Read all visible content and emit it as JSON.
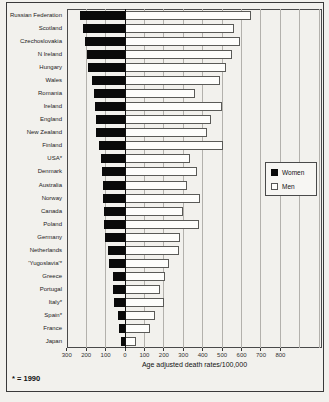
{
  "figure": {
    "xlabel": "Age adjusted death rates/100,000",
    "footnote": "* = 1990",
    "legend": {
      "women_label": "Women",
      "men_label": "Men"
    }
  },
  "chart_data": {
    "type": "bar",
    "orientation": "horizontal-bilateral",
    "title": "",
    "xlabel": "Age adjusted death rates/100,000",
    "footnote": "* = 1990",
    "legend_position": "middle-right-inside",
    "grid": true,
    "axis": {
      "left_max": 300,
      "right_max": 800,
      "tick_step": 100,
      "tick_values": [
        -300,
        -200,
        -100,
        0,
        100,
        200,
        300,
        400,
        500,
        600,
        700,
        800
      ],
      "gridline_values": [
        -200,
        -100,
        0,
        100,
        200,
        300,
        400,
        500,
        600,
        700,
        800,
        900,
        1000
      ]
    },
    "categories": [
      "Russian Federation",
      "Scotland",
      "Czechoslovakia",
      "N Ireland",
      "Hungary",
      "Wales",
      "Romania",
      "Ireland",
      "England",
      "New Zealand",
      "Finland",
      "USA*",
      "Denmark",
      "Australia",
      "Norway",
      "Canada",
      "Poland",
      "Germany",
      "Netherlands",
      "'Yugoslavia'*",
      "Greece",
      "Portugal",
      "Italy*",
      "Spain*",
      "France",
      "Japan"
    ],
    "series": [
      {
        "name": "Women",
        "side": "left",
        "color": "#000000",
        "values": [
          230,
          218,
          206,
          196,
          188,
          168,
          158,
          156,
          150,
          148,
          132,
          124,
          118,
          114,
          112,
          108,
          106,
          102,
          85,
          80,
          62,
          60,
          55,
          38,
          30,
          22
        ]
      },
      {
        "name": "Men",
        "side": "right",
        "color": "#ffffff",
        "values": [
          650,
          560,
          590,
          550,
          520,
          490,
          360,
          500,
          445,
          420,
          505,
          335,
          370,
          320,
          385,
          300,
          380,
          285,
          280,
          225,
          205,
          180,
          200,
          155,
          130,
          55
        ]
      }
    ]
  }
}
